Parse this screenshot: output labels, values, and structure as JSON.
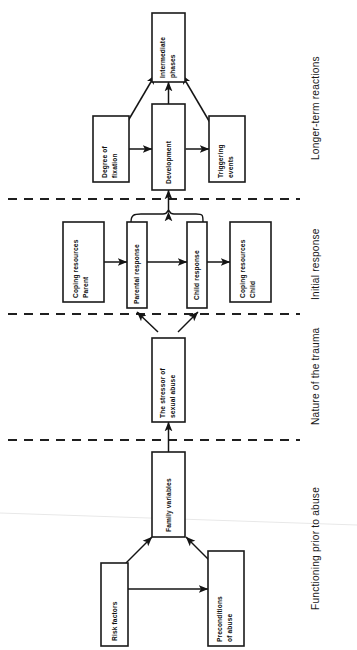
{
  "figure": {
    "orientation": "rotated-90-ccw"
  },
  "sections": [
    {
      "id": "longer-term",
      "label": "Longer-term reactions"
    },
    {
      "id": "initial",
      "label": "Initial response"
    },
    {
      "id": "trauma",
      "label": "Nature of the trauma"
    },
    {
      "id": "prior",
      "label": "Functioning prior to abuse"
    }
  ],
  "boxes": [
    {
      "id": "intermediate-phases",
      "line1": "Intermediate",
      "line2": "phases"
    },
    {
      "id": "degree-of-fixation",
      "line1": "Degree of",
      "line2": "fixation"
    },
    {
      "id": "development",
      "line1": "Development",
      "line2": ""
    },
    {
      "id": "triggering-events",
      "line1": "Triggering",
      "line2": "events"
    },
    {
      "id": "coping-resources-parent",
      "line1": "Coping resources",
      "line2": "Parent"
    },
    {
      "id": "parental-response",
      "line1": "Parental response",
      "line2": ""
    },
    {
      "id": "child-response",
      "line1": "Child response",
      "line2": ""
    },
    {
      "id": "coping-resources-child",
      "line1": "Coping resources",
      "line2": "Child"
    },
    {
      "id": "the-stressor-of-sexual-abuse",
      "line1": "The stressor of",
      "line2": "sexual abuse"
    },
    {
      "id": "family-variables",
      "line1": "Family variables",
      "line2": ""
    },
    {
      "id": "risk-factors",
      "line1": "Risk factors",
      "line2": ""
    },
    {
      "id": "preconditions-of-abuse",
      "line1": "Preconditions",
      "line2": "of abuse"
    }
  ],
  "colors": {
    "ink": "#141414",
    "paper": "#ffffff",
    "box_stroke": "#1a1a1a"
  }
}
